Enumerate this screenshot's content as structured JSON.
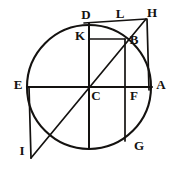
{
  "figure": {
    "kind": "euclidean-geometry-figure",
    "ink_color": "#141210",
    "background_color": "#ffffff",
    "canvas": {
      "width": 179,
      "height": 169
    },
    "circle": {
      "center_label": "C",
      "cx": 89,
      "cy": 87,
      "r": 62
    },
    "labels": [
      {
        "id": "D",
        "text": "D",
        "x": 86,
        "y": 16
      },
      {
        "id": "L",
        "text": "L",
        "x": 120,
        "y": 15
      },
      {
        "id": "H",
        "text": "H",
        "x": 152,
        "y": 14
      },
      {
        "id": "K",
        "text": "K",
        "x": 80,
        "y": 37
      },
      {
        "id": "B",
        "text": "B",
        "x": 134,
        "y": 41
      },
      {
        "id": "E",
        "text": "E",
        "x": 18,
        "y": 86
      },
      {
        "id": "A",
        "text": "A",
        "x": 161,
        "y": 86
      },
      {
        "id": "C",
        "text": "C",
        "x": 96,
        "y": 97
      },
      {
        "id": "F",
        "text": "F",
        "x": 134,
        "y": 97
      },
      {
        "id": "G",
        "text": "G",
        "x": 139,
        "y": 147
      },
      {
        "id": "I",
        "text": "I",
        "x": 22,
        "y": 152
      }
    ],
    "points": [
      {
        "id": "D",
        "x": 89,
        "y": 24
      },
      {
        "id": "L",
        "x": 126,
        "y": 22
      },
      {
        "id": "H",
        "x": 146,
        "y": 19
      },
      {
        "id": "K",
        "x": 89,
        "y": 39
      },
      {
        "id": "B",
        "x": 125,
        "y": 39
      },
      {
        "id": "E",
        "x": 28,
        "y": 87
      },
      {
        "id": "A",
        "x": 149,
        "y": 88
      },
      {
        "id": "C",
        "x": 89,
        "y": 87
      },
      {
        "id": "F",
        "x": 125,
        "y": 88
      },
      {
        "id": "G",
        "x": 130,
        "y": 138
      },
      {
        "id": "I",
        "x": 31,
        "y": 158
      }
    ],
    "segments": [
      {
        "id": "diameter-EA",
        "from": "E",
        "to": "A"
      },
      {
        "id": "diameter-DG-vert",
        "from": "D",
        "to": "G-bottom"
      },
      {
        "id": "chord-KB",
        "from": "K",
        "to": "B"
      },
      {
        "id": "tangent-DLH",
        "from": "D",
        "to": "H"
      },
      {
        "id": "vertical-BF",
        "from": "B",
        "to": "F-bottom"
      },
      {
        "id": "vertical-HA",
        "from": "H",
        "to": "A"
      },
      {
        "id": "hypotenuse-HBI",
        "from": "H",
        "to": "I"
      },
      {
        "id": "vertical-EI",
        "from": "E",
        "to": "I"
      },
      {
        "id": "diagonal-BCI",
        "from": "B",
        "to": "I"
      }
    ],
    "arcs": [
      {
        "id": "main-circle",
        "description": "full circle through E, D, A, G"
      }
    ]
  }
}
